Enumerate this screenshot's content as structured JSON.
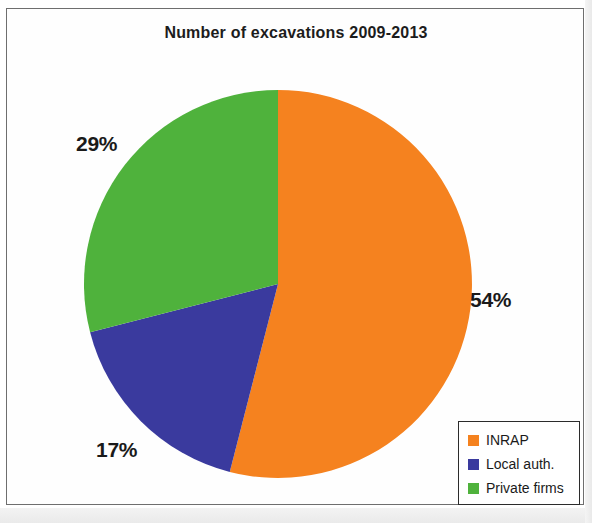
{
  "chart_data": {
    "type": "pie",
    "title": "Number of excavations 2009-2013",
    "xlabel": "",
    "ylabel": "",
    "categories": [
      "INRAP",
      "Local auth.",
      "Private firms"
    ],
    "values": [
      54,
      17,
      29
    ],
    "value_unit": "%",
    "data_labels": [
      "54%",
      "17%",
      "29%"
    ],
    "colors": [
      "#F5821F",
      "#3A3A9E",
      "#4FB23C"
    ],
    "legend": {
      "position": "bottom-right",
      "entries": [
        {
          "label": "INRAP",
          "color": "#F5821F"
        },
        {
          "label": "Local auth.",
          "color": "#3A3A9E"
        },
        {
          "label": "Private firms",
          "color": "#4FB23C"
        }
      ]
    },
    "start_angle_deg": 0,
    "direction": "clockwise",
    "grid": false
  },
  "figure": {
    "title": "Number of excavations 2009-2013",
    "labels": {
      "inrap_pct": "54%",
      "local_auth_pct": "17%",
      "private_firms_pct": "29%"
    }
  }
}
